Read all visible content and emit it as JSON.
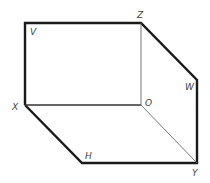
{
  "diagram": {
    "type": "isometric box / hexagonal prism outline",
    "stroke_color": "#1a1a1a",
    "hidden_edge_color": "#555555",
    "points": {
      "V": {
        "x": 25,
        "y": 23
      },
      "Z": {
        "x": 141,
        "y": 23
      },
      "W": {
        "x": 197,
        "y": 80
      },
      "Y": {
        "x": 197,
        "y": 163
      },
      "H": {
        "x": 82,
        "y": 163
      },
      "X": {
        "x": 25,
        "y": 105
      },
      "O": {
        "x": 141,
        "y": 105
      }
    },
    "labels": {
      "V": "V",
      "Z": "Z",
      "W": "W",
      "Y": "Y",
      "H": "H",
      "X": "X",
      "O": "O"
    }
  }
}
